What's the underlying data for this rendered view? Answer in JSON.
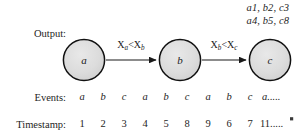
{
  "figure": {
    "title_caption": "",
    "background_color": "#ffffff",
    "node_fill_color": "#d9d9d9",
    "node_stroke_color": "#1a1a1a",
    "axis_color": "#8c8c8c"
  },
  "output": {
    "label": "Output:",
    "values": [
      "a1, b2, c3",
      "a4, b5, c8"
    ]
  },
  "graph": {
    "nodes": [
      {
        "id": "a",
        "label": "a",
        "cx": 84,
        "cy": 60,
        "r": 21
      },
      {
        "id": "b",
        "label": "b",
        "cx": 180,
        "cy": 60,
        "r": 21
      },
      {
        "id": "c",
        "label": "c",
        "cx": 270,
        "cy": 60,
        "r": 21
      }
    ],
    "edges": [
      {
        "from": "a",
        "to": "b",
        "label_main": "X",
        "label_sub1": "a",
        "label_mid": "<X",
        "label_sub2": "b",
        "label_text": "Xa<Xb"
      },
      {
        "from": "b",
        "to": "c",
        "label_main": "X",
        "label_sub1": "b",
        "label_mid": "<X",
        "label_sub2": "c",
        "label_text": "Xb<Xc"
      }
    ]
  },
  "timeline": {
    "events_label": "Events:",
    "timestamp_label": "Timestamp:",
    "events": [
      "a",
      "b",
      "c",
      "a",
      "b",
      "c",
      "a",
      "b",
      "c"
    ],
    "events_tail": "a.....",
    "timestamps": [
      "1",
      "2",
      "3",
      "4",
      "5",
      "8",
      "9",
      "6",
      "7"
    ],
    "timestamps_tail": "11....."
  }
}
